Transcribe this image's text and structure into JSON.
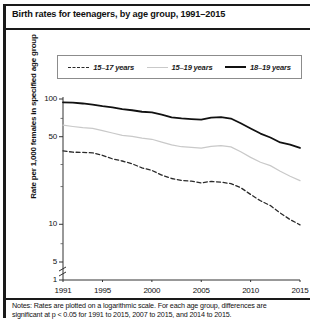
{
  "figure": {
    "title": "Birth rates for teenagers, by age group, 1991–2015",
    "notes_line1": "Notes: Rates are plotted on a logarithmic scale. For each age group, differences are",
    "notes_line2": "significant at p < 0.05 for 1991 to 2015, 2007 to 2015, and 2014 to 2015."
  },
  "legend": {
    "items": [
      {
        "label": "15–17 years",
        "style": "dashed",
        "color": "#2a2a2a"
      },
      {
        "label": "15–19 years",
        "style": "solid-light",
        "color": "#c9c9c9"
      },
      {
        "label": "18–19 years",
        "style": "solid-bold",
        "color": "#111111"
      }
    ]
  },
  "axes": {
    "ylabel": "Rate per 1,000 females in specified age group",
    "y_ticks": [
      "100",
      "50",
      "10",
      "5",
      "1"
    ],
    "x_ticks": [
      "1991",
      "1995",
      "2000",
      "2005",
      "2010",
      "2015"
    ],
    "axis_break": true
  },
  "chart_data": {
    "type": "line",
    "title": "Birth rates for teenagers, by age group, 1991–2015",
    "xlabel": "",
    "ylabel": "Rate per 1,000 females in specified age group",
    "yscale": "log",
    "ylim": [
      1,
      130
    ],
    "xlim": [
      1991,
      2015
    ],
    "grid": false,
    "legend_position": "top",
    "x": [
      1991,
      1992,
      1993,
      1994,
      1995,
      1996,
      1997,
      1998,
      1999,
      2000,
      2001,
      2002,
      2003,
      2004,
      2005,
      2006,
      2007,
      2008,
      2009,
      2010,
      2011,
      2012,
      2013,
      2014,
      2015
    ],
    "series": [
      {
        "name": "18–19 years",
        "style": "solid-bold",
        "color": "#111111",
        "values": [
          94.0,
          93.6,
          92.1,
          90.2,
          87.7,
          85.9,
          82.9,
          81.3,
          79.1,
          78.1,
          75.1,
          71.4,
          70.0,
          69.1,
          68.4,
          71.1,
          71.7,
          69.8,
          64.0,
          58.2,
          53.0,
          49.3,
          45.0,
          43.2,
          40.7
        ]
      },
      {
        "name": "15–19 years",
        "style": "solid-light",
        "color": "#c9c9c9",
        "values": [
          61.8,
          60.3,
          59.0,
          58.2,
          56.0,
          53.5,
          51.3,
          50.3,
          48.8,
          47.7,
          45.3,
          43.0,
          41.6,
          41.1,
          40.5,
          41.9,
          42.5,
          41.5,
          37.9,
          34.2,
          31.3,
          29.4,
          26.5,
          24.2,
          22.3
        ]
      },
      {
        "name": "15–17 years",
        "style": "dashed",
        "color": "#2a2a2a",
        "values": [
          38.6,
          37.6,
          37.5,
          37.2,
          35.5,
          33.3,
          32.0,
          30.4,
          28.2,
          26.9,
          24.7,
          23.2,
          22.4,
          22.1,
          21.4,
          22.0,
          21.7,
          21.1,
          19.6,
          17.3,
          15.4,
          14.1,
          12.3,
          10.9,
          9.9
        ]
      }
    ]
  }
}
